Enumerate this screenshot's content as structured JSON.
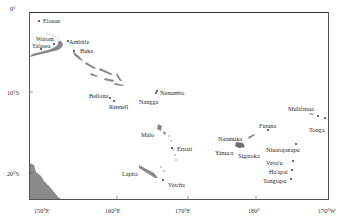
{
  "map": {
    "frame_color": "#555555",
    "land_color": "#8a8a8a",
    "axes": {
      "lat_ticks": [
        {
          "label": "0°",
          "x": 10,
          "y": 7
        },
        {
          "label": "10°S",
          "x": 7,
          "y": 91
        },
        {
          "label": "20°S",
          "x": 7,
          "y": 172
        }
      ],
      "lon_ticks": [
        {
          "label": "150°E",
          "x": 34,
          "y": 207
        },
        {
          "label": "160°E",
          "x": 105,
          "y": 207
        },
        {
          "label": "170°E",
          "x": 175,
          "y": 207
        },
        {
          "label": "180°",
          "x": 248,
          "y": 207
        },
        {
          "label": "170°W",
          "x": 318,
          "y": 207
        }
      ]
    },
    "places": [
      {
        "name": "Elouae",
        "x": 41,
        "y": 18
      },
      {
        "name": "Watom",
        "x": 35,
        "y": 36
      },
      {
        "name": "Talasea",
        "x": 32,
        "y": 43
      },
      {
        "name": "Ambitle",
        "x": 68,
        "y": 38
      },
      {
        "name": "Buka",
        "x": 80,
        "y": 47
      },
      {
        "name": "Bellona",
        "x": 89,
        "y": 91
      },
      {
        "name": "Rennell",
        "x": 107,
        "y": 99
      },
      {
        "name": "Nenumbo",
        "x": 160,
        "y": 89
      },
      {
        "name": "Nangga",
        "x": 138,
        "y": 97
      },
      {
        "name": "Malo",
        "x": 141,
        "y": 131
      },
      {
        "name": "Eruati",
        "x": 174,
        "y": 145
      },
      {
        "name": "Futuna",
        "x": 259,
        "y": 122
      },
      {
        "name": "Mulifanua",
        "x": 288,
        "y": 105
      },
      {
        "name": "Tonga",
        "x": 309,
        "y": 125
      },
      {
        "name": "Natunuka",
        "x": 218,
        "y": 135
      },
      {
        "name": "Yanuca",
        "x": 215,
        "y": 148
      },
      {
        "name": "Sigatoka",
        "x": 238,
        "y": 152
      },
      {
        "name": "Niuatoputapu",
        "x": 266,
        "y": 146
      },
      {
        "name": "Vava'u",
        "x": 266,
        "y": 159
      },
      {
        "name": "Ha'apai",
        "x": 269,
        "y": 169
      },
      {
        "name": "Tongtapu",
        "x": 263,
        "y": 178
      },
      {
        "name": "Lapita",
        "x": 122,
        "y": 170
      },
      {
        "name": "Vatcha",
        "x": 168,
        "y": 181
      }
    ]
  }
}
